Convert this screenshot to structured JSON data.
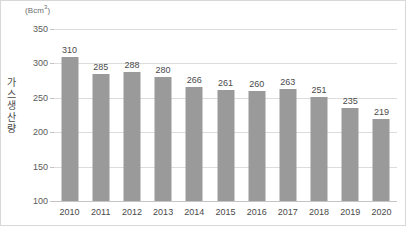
{
  "chart_data": {
    "type": "bar",
    "title": "",
    "subtitle": "",
    "unit_label": "(Bcm",
    "unit_superscript": "3",
    "unit_label_close": ")",
    "xlabel": "",
    "ylabel": "가스 생산량",
    "ylim": [
      100,
      350
    ],
    "ytick_labels": [
      "350",
      "300",
      "250",
      "200",
      "150",
      "100"
    ],
    "ytick_values": [
      350,
      300,
      250,
      200,
      150,
      100
    ],
    "grid": true,
    "legend": "none",
    "categories": [
      "2010",
      "2011",
      "2012",
      "2013",
      "2014",
      "2015",
      "2016",
      "2017",
      "2018",
      "2019",
      "2020"
    ],
    "values": [
      310,
      285,
      288,
      280,
      266,
      261,
      260,
      263,
      251,
      235,
      219
    ],
    "value_labels": [
      "310",
      "285",
      "288",
      "280",
      "266",
      "261",
      "260",
      "263",
      "251",
      "235",
      "219"
    ],
    "colors": {
      "bar": "#9a9a9a",
      "gridline": "#dcdcdc",
      "baseline": "#c4c4c4",
      "text": "#4a4a4a",
      "tick_text": "#5a5a5a",
      "unit_text": "#6d6d6d",
      "background": "#ffffff",
      "border": "#d8d8d8"
    }
  }
}
